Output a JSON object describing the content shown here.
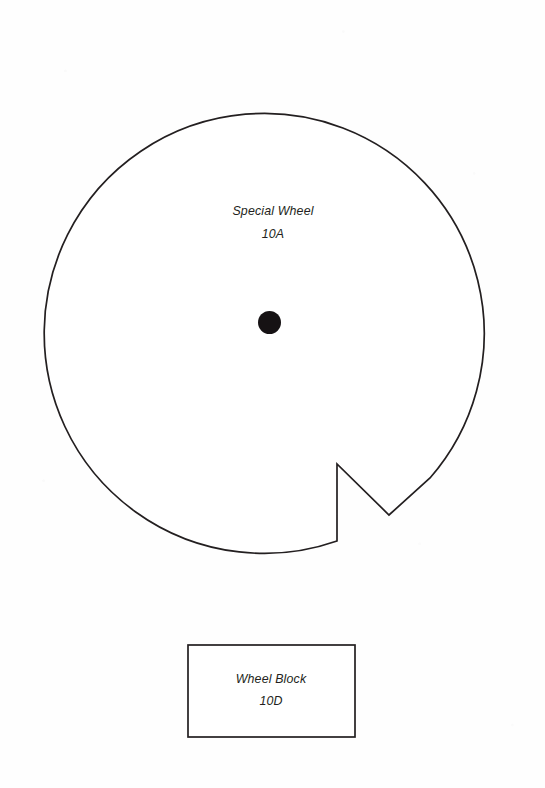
{
  "document": {
    "type": "technical-drawing",
    "sheet_width": 545,
    "sheet_height": 788,
    "background_color": "#fefefe",
    "line_color": "#231f20"
  },
  "parts": {
    "wheel": {
      "name": "special-wheel",
      "title": "Special Wheel",
      "part_number": "10A",
      "shape": "circle-with-v-notch",
      "center_x": 269.5,
      "center_y": 322,
      "radius": 220,
      "hub": {
        "name": "center-hub-dot",
        "center_x": 269.5,
        "center_y": 322.5,
        "radius": 11.5,
        "color": "#161214"
      },
      "notch": {
        "name": "keyway-notch",
        "vertical_x": 337,
        "vertical_top_y": 464,
        "vertical_bottom_y": 541,
        "vee_point_x": 389,
        "vee_point_y": 515,
        "rejoin_x": 430,
        "rejoin_y": 478
      },
      "label_line1_x": 273,
      "label_line1_y": 215,
      "label_line2_x": 273,
      "label_line2_y": 238
    },
    "block": {
      "name": "wheel-block",
      "title": "Wheel Block",
      "part_number": "10D",
      "shape": "rectangle",
      "x": 188,
      "y": 645,
      "width": 167,
      "height": 92,
      "label_line1_x": 271,
      "label_line1_y": 683,
      "label_line2_x": 271,
      "label_line2_y": 705
    }
  }
}
